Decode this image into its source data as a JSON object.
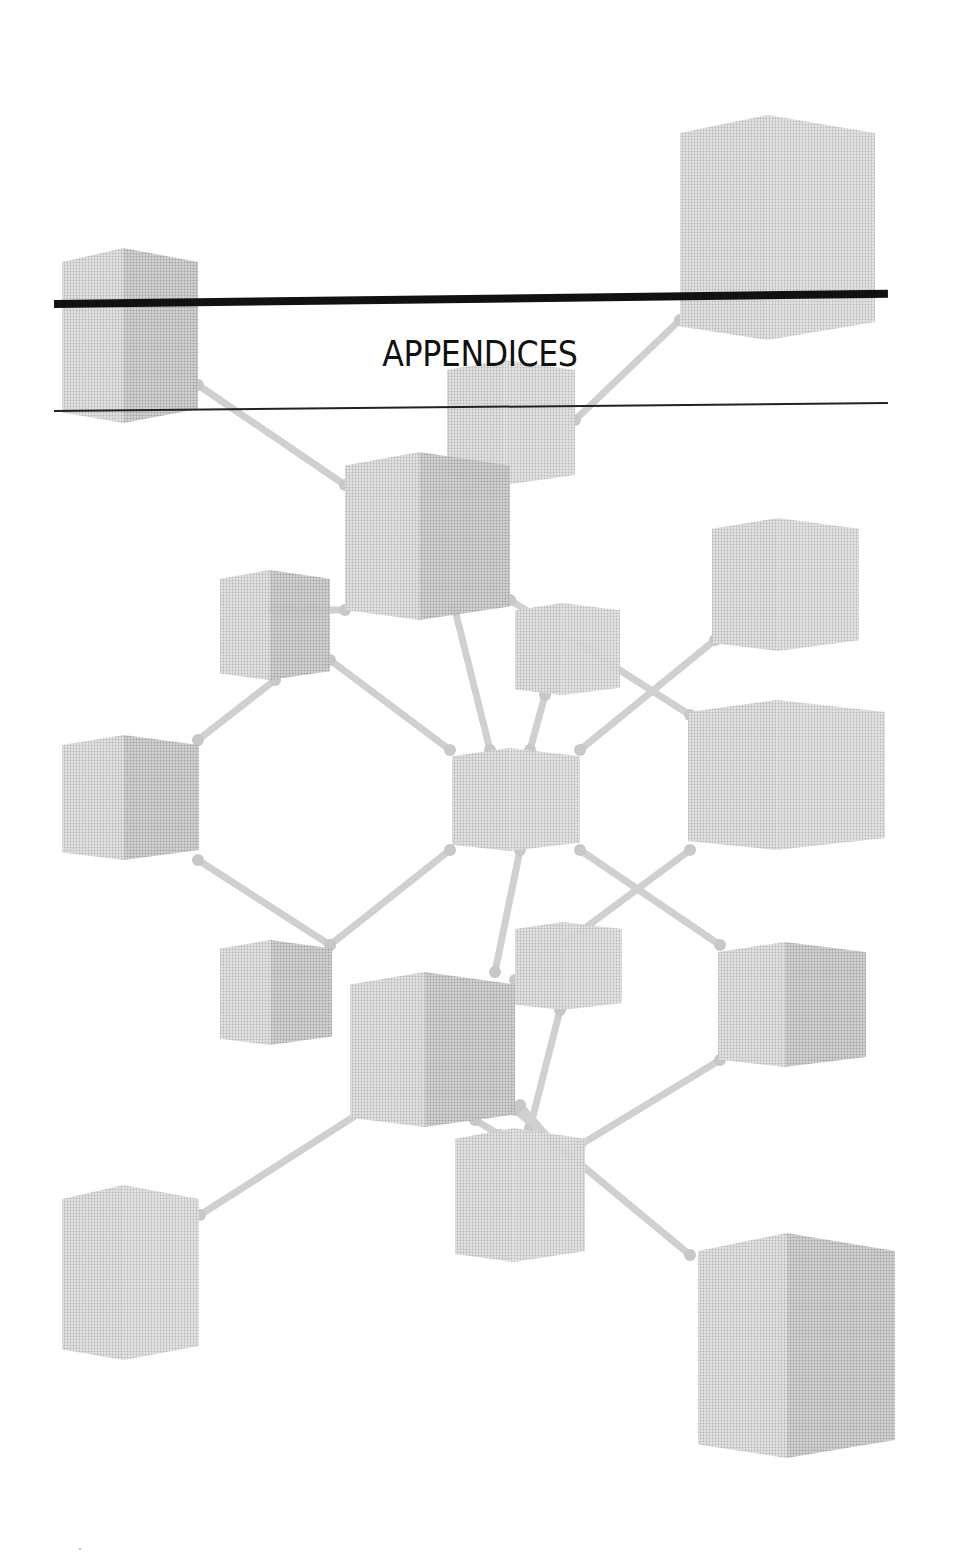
{
  "page": {
    "title": "APPENDICES",
    "colors": {
      "background": "#ffffff",
      "rule": "#111111",
      "cube_light": "#dcdcdc",
      "cube_mid": "#c8c8c8",
      "cube_dark": "#b4b4b4",
      "rod": "#cfcfcf"
    },
    "illustration": {
      "description": "molecular-lattice-of-gray-cubes",
      "cubes": [
        {
          "id": "c1",
          "x": 680,
          "y": 115,
          "w": 195,
          "h": 225
        },
        {
          "id": "c2",
          "x": 62,
          "y": 248,
          "w": 136,
          "h": 175
        },
        {
          "id": "c3",
          "x": 447,
          "y": 360,
          "w": 128,
          "h": 125
        },
        {
          "id": "c4",
          "x": 345,
          "y": 452,
          "w": 165,
          "h": 168
        },
        {
          "id": "c5",
          "x": 220,
          "y": 570,
          "w": 110,
          "h": 110
        },
        {
          "id": "c6",
          "x": 515,
          "y": 603,
          "w": 105,
          "h": 92
        },
        {
          "id": "c7",
          "x": 712,
          "y": 518,
          "w": 147,
          "h": 133
        },
        {
          "id": "c8",
          "x": 62,
          "y": 735,
          "w": 137,
          "h": 125
        },
        {
          "id": "c9",
          "x": 452,
          "y": 748,
          "w": 128,
          "h": 103
        },
        {
          "id": "c10",
          "x": 688,
          "y": 700,
          "w": 197,
          "h": 150
        },
        {
          "id": "c11",
          "x": 220,
          "y": 940,
          "w": 112,
          "h": 105
        },
        {
          "id": "c12",
          "x": 515,
          "y": 922,
          "w": 107,
          "h": 88
        },
        {
          "id": "c13",
          "x": 350,
          "y": 972,
          "w": 165,
          "h": 155
        },
        {
          "id": "c14",
          "x": 718,
          "y": 942,
          "w": 148,
          "h": 125
        },
        {
          "id": "c15",
          "x": 455,
          "y": 1128,
          "w": 130,
          "h": 134
        },
        {
          "id": "c16",
          "x": 62,
          "y": 1185,
          "w": 137,
          "h": 175
        },
        {
          "id": "c17",
          "x": 698,
          "y": 1233,
          "w": 197,
          "h": 225
        }
      ],
      "rods": [
        [
          198,
          385,
          345,
          485
        ],
        [
          680,
          320,
          575,
          420
        ],
        [
          345,
          610,
          275,
          610
        ],
        [
          510,
          600,
          690,
          715
        ],
        [
          455,
          610,
          490,
          750
        ],
        [
          545,
          695,
          530,
          750
        ],
        [
          715,
          640,
          580,
          750
        ],
        [
          330,
          660,
          450,
          750
        ],
        [
          275,
          680,
          198,
          740
        ],
        [
          198,
          860,
          330,
          945
        ],
        [
          450,
          850,
          330,
          945
        ],
        [
          520,
          850,
          495,
          972
        ],
        [
          580,
          850,
          720,
          945
        ],
        [
          690,
          850,
          515,
          980
        ],
        [
          560,
          1010,
          530,
          1128
        ],
        [
          380,
          1100,
          200,
          1215
        ],
        [
          515,
          1110,
          690,
          1255
        ],
        [
          720,
          1060,
          580,
          1145
        ],
        [
          475,
          1120,
          500,
          1135
        ],
        [
          555,
          1145,
          520,
          1105
        ]
      ]
    }
  }
}
